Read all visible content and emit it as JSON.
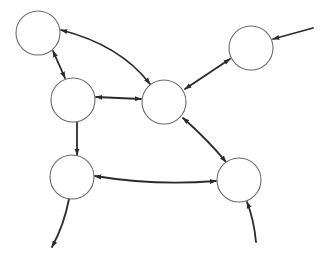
{
  "diagram": {
    "type": "directed-graph",
    "background": "#ffffff",
    "node_stroke": "#6a6a6a",
    "edge_color": "#2b2b2b",
    "node_radius": 22,
    "nodes": [
      {
        "id": "n1",
        "x": 38,
        "y": 33,
        "label": ""
      },
      {
        "id": "n2",
        "x": 251,
        "y": 48,
        "label": ""
      },
      {
        "id": "n3",
        "x": 73,
        "y": 100,
        "label": ""
      },
      {
        "id": "n4",
        "x": 164,
        "y": 102,
        "label": ""
      },
      {
        "id": "n5",
        "x": 72,
        "y": 177,
        "label": ""
      },
      {
        "id": "n6",
        "x": 239,
        "y": 180,
        "label": ""
      }
    ],
    "edges": [
      {
        "from": "n4",
        "to": "n1",
        "bidirectional": true,
        "curved": true
      },
      {
        "from": "n1",
        "to": "n3",
        "bidirectional": true,
        "curved": false
      },
      {
        "from": "n3",
        "to": "n4",
        "bidirectional": true,
        "curved": false
      },
      {
        "from": "n4",
        "to": "n2",
        "bidirectional": true,
        "curved": false
      },
      {
        "from": "external-top-right",
        "to": "n2",
        "bidirectional": false,
        "curved": false
      },
      {
        "from": "n3",
        "to": "n5",
        "bidirectional": false,
        "curved": false
      },
      {
        "from": "n5",
        "to": "n6",
        "bidirectional": true,
        "curved": true
      },
      {
        "from": "n4",
        "to": "n6",
        "bidirectional": true,
        "curved": true
      },
      {
        "from": "external-bottom",
        "to": "n6",
        "bidirectional": false,
        "curved": true
      },
      {
        "from": "n5",
        "to": "external-bottom-left",
        "bidirectional": false,
        "curved": true
      }
    ]
  }
}
